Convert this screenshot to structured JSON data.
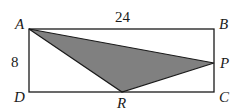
{
  "figure": {
    "type": "geometry",
    "rectangle": {
      "vertices": [
        "A",
        "B",
        "C",
        "D"
      ],
      "width_label": "24",
      "height_label": "8"
    },
    "triangle": {
      "vertices": [
        "A",
        "P",
        "R"
      ],
      "fill": "#808080"
    },
    "points": {
      "A": {
        "label": "A",
        "x": 29,
        "y": 29
      },
      "B": {
        "label": "B",
        "x": 214,
        "y": 29
      },
      "C": {
        "label": "C",
        "x": 214,
        "y": 92
      },
      "D": {
        "label": "D",
        "x": 29,
        "y": 92
      },
      "P": {
        "label": "P",
        "x": 214,
        "y": 63
      },
      "R": {
        "label": "R",
        "x": 122,
        "y": 92
      }
    },
    "labels": {
      "top_side": "24",
      "left_side": "8",
      "A": "A",
      "B": "B",
      "C": "C",
      "D": "D",
      "P": "P",
      "R": "R"
    },
    "colors": {
      "stroke": "#1a1a1a",
      "shade": "#808080"
    }
  }
}
